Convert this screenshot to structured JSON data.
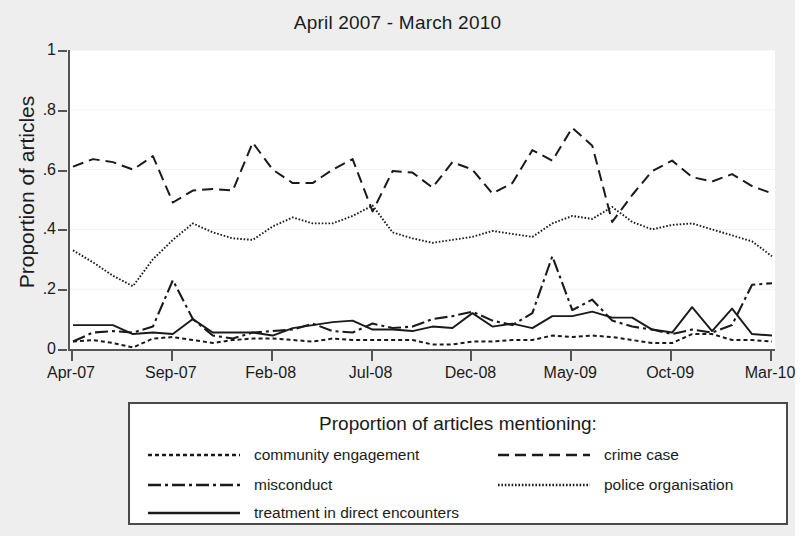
{
  "chart_data": {
    "type": "line",
    "title": "April 2007 - March 2010",
    "xlabel": "",
    "ylabel": "Proportion of articles",
    "ylim": [
      0,
      1
    ],
    "ytick_labels": [
      "0",
      ".2",
      ".4",
      ".6",
      ".8",
      "1"
    ],
    "ytick_values": [
      0,
      0.2,
      0.4,
      0.6,
      0.8,
      1
    ],
    "grid": "horizontal-faint",
    "legend_position": "below-plot",
    "legend_title": "Proportion of articles mentioning:",
    "x": [
      "Apr-07",
      "May-07",
      "Jun-07",
      "Jul-07",
      "Aug-07",
      "Sep-07",
      "Oct-07",
      "Nov-07",
      "Dec-07",
      "Jan-08",
      "Feb-08",
      "Mar-08",
      "Apr-08",
      "May-08",
      "Jun-08",
      "Jul-08",
      "Aug-08",
      "Sep-08",
      "Oct-08",
      "Nov-08",
      "Dec-08",
      "Jan-09",
      "Feb-09",
      "Mar-09",
      "Apr-09",
      "May-09",
      "Jun-09",
      "Jul-09",
      "Aug-09",
      "Sep-09",
      "Oct-09",
      "Nov-09",
      "Dec-09",
      "Jan-10",
      "Feb-10",
      "Mar-10"
    ],
    "xtick_labels": [
      "Apr-07",
      "Sep-07",
      "Feb-08",
      "Jul-08",
      "Dec-08",
      "May-09",
      "Oct-09",
      "Mar-10"
    ],
    "xtick_indices": [
      0,
      5,
      10,
      15,
      20,
      25,
      30,
      35
    ],
    "series": [
      {
        "name": "crime case",
        "dash": "long-dash",
        "values": [
          0.61,
          0.635,
          0.625,
          0.6,
          0.645,
          0.49,
          0.53,
          0.535,
          0.53,
          0.69,
          0.6,
          0.555,
          0.555,
          0.6,
          0.635,
          0.46,
          0.595,
          0.59,
          0.54,
          0.625,
          0.6,
          0.52,
          0.555,
          0.665,
          0.63,
          0.74,
          0.68,
          0.425,
          0.515,
          0.595,
          0.63,
          0.575,
          0.56,
          0.585,
          0.545,
          0.52
        ]
      },
      {
        "name": "police organisation",
        "dash": "fine-dot",
        "values": [
          0.33,
          0.29,
          0.245,
          0.21,
          0.3,
          0.365,
          0.42,
          0.39,
          0.37,
          0.365,
          0.41,
          0.44,
          0.42,
          0.42,
          0.445,
          0.48,
          0.39,
          0.37,
          0.355,
          0.365,
          0.375,
          0.395,
          0.385,
          0.375,
          0.42,
          0.445,
          0.435,
          0.475,
          0.425,
          0.4,
          0.415,
          0.42,
          0.4,
          0.38,
          0.36,
          0.31
        ]
      },
      {
        "name": "misconduct",
        "dash": "dash-dot",
        "values": [
          0.025,
          0.055,
          0.06,
          0.055,
          0.075,
          0.23,
          0.1,
          0.045,
          0.035,
          0.055,
          0.06,
          0.065,
          0.085,
          0.06,
          0.055,
          0.085,
          0.07,
          0.075,
          0.1,
          0.11,
          0.125,
          0.095,
          0.08,
          0.12,
          0.31,
          0.13,
          0.165,
          0.095,
          0.075,
          0.065,
          0.05,
          0.065,
          0.055,
          0.08,
          0.215,
          0.22
        ]
      },
      {
        "name": "treatment in direct encounters",
        "dash": "solid",
        "values": [
          0.08,
          0.08,
          0.08,
          0.05,
          0.055,
          0.05,
          0.1,
          0.055,
          0.055,
          0.055,
          0.045,
          0.07,
          0.08,
          0.09,
          0.095,
          0.065,
          0.065,
          0.06,
          0.075,
          0.07,
          0.12,
          0.075,
          0.085,
          0.07,
          0.11,
          0.11,
          0.125,
          0.105,
          0.105,
          0.065,
          0.055,
          0.14,
          0.06,
          0.135,
          0.05,
          0.045
        ]
      },
      {
        "name": "community engagement",
        "dash": "dot",
        "values": [
          0.025,
          0.03,
          0.02,
          0.005,
          0.035,
          0.04,
          0.03,
          0.02,
          0.03,
          0.035,
          0.035,
          0.03,
          0.025,
          0.035,
          0.03,
          0.03,
          0.03,
          0.03,
          0.015,
          0.015,
          0.025,
          0.025,
          0.03,
          0.03,
          0.045,
          0.04,
          0.045,
          0.04,
          0.03,
          0.02,
          0.02,
          0.05,
          0.05,
          0.03,
          0.03,
          0.025
        ]
      }
    ]
  },
  "legend": {
    "title": "Proportion of articles mentioning:",
    "entries": [
      {
        "label": "community engagement",
        "style": "dot"
      },
      {
        "label": "crime case",
        "style": "long-dash"
      },
      {
        "label": "misconduct",
        "style": "dash-dot"
      },
      {
        "label": "police organisation",
        "style": "fine-dot"
      },
      {
        "label": "treatment in direct encounters",
        "style": "solid"
      }
    ]
  },
  "colors": {
    "line": "#1a1a1a",
    "axis": "#555555",
    "plot_background": "#ffffff",
    "figure_background": "#eeeeee",
    "grid": "#f2f2f2"
  }
}
